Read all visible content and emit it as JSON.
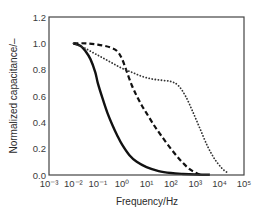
{
  "chart_data": {
    "type": "line",
    "title": "",
    "xlabel": "Frequency/Hz",
    "ylabel": "Normalized capacitance/–",
    "xscale": "log",
    "xlim": [
      0.001,
      100000
    ],
    "ylim": [
      0.0,
      1.2
    ],
    "grid": false,
    "legend": null,
    "x_ticks": [
      "10⁻³",
      "10⁻²",
      "10⁻¹",
      "10⁰",
      "10¹",
      "10²",
      "10³",
      "10⁴",
      "10⁵"
    ],
    "y_ticks": [
      "0.0",
      "0.2",
      "0.4",
      "0.6",
      "0.8",
      "1.0",
      "1.2"
    ],
    "series": [
      {
        "name": "solid",
        "style": "solid",
        "color": "#111111",
        "log10_x": [
          -2.0,
          -1.7,
          -1.5,
          -1.3,
          -1.1,
          -1.0,
          -0.8,
          -0.6,
          -0.4,
          -0.2,
          0.0,
          0.3,
          0.6,
          1.0,
          1.5,
          2.0,
          2.5,
          3.0,
          3.6
        ],
        "y": [
          1.0,
          0.98,
          0.94,
          0.88,
          0.78,
          0.7,
          0.58,
          0.47,
          0.38,
          0.3,
          0.23,
          0.15,
          0.1,
          0.06,
          0.03,
          0.015,
          0.008,
          0.004,
          0.002
        ]
      },
      {
        "name": "dashed",
        "style": "dashed",
        "color": "#111111",
        "log10_x": [
          -2.0,
          -1.5,
          -1.0,
          -0.5,
          -0.2,
          0.0,
          0.2,
          0.4,
          0.6,
          0.8,
          1.0,
          1.3,
          1.6,
          2.0,
          2.4,
          2.8,
          3.2
        ],
        "y": [
          1.0,
          1.0,
          0.99,
          0.97,
          0.94,
          0.88,
          0.78,
          0.68,
          0.6,
          0.53,
          0.47,
          0.38,
          0.3,
          0.2,
          0.11,
          0.04,
          0.0
        ]
      },
      {
        "name": "dotted",
        "style": "dotted",
        "color": "#333333",
        "log10_x": [
          -2.0,
          -1.6,
          -1.2,
          -0.8,
          -0.4,
          0.0,
          0.4,
          0.8,
          1.2,
          1.6,
          2.0,
          2.3,
          2.6,
          2.9,
          3.2,
          3.5,
          3.8,
          4.1,
          4.3
        ],
        "y": [
          1.0,
          0.97,
          0.93,
          0.89,
          0.85,
          0.81,
          0.78,
          0.75,
          0.73,
          0.72,
          0.71,
          0.68,
          0.6,
          0.48,
          0.35,
          0.22,
          0.12,
          0.05,
          0.02
        ]
      }
    ]
  }
}
